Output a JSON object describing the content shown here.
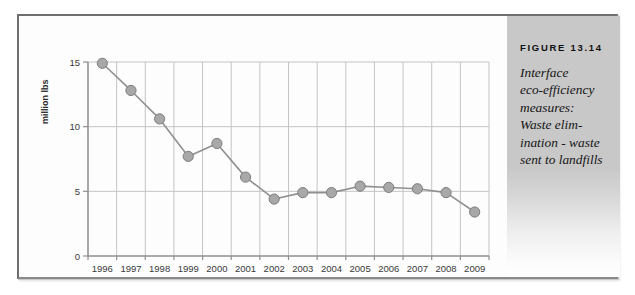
{
  "figure": {
    "caption_number": "FIGURE 13.14",
    "caption_text": "Interface eco-efficiency measures: Waste elimination - waste sent to landfills",
    "caption_lines": [
      "Interface",
      "eco-efficiency",
      "measures:",
      "Waste elim-",
      "ination - waste",
      "sent to landfills"
    ]
  },
  "colors": {
    "marker_fill": "#a8a8a8",
    "marker_stroke": "#7d7d7d",
    "line": "#909090",
    "grid": "#c4c4c4",
    "axis": "#8f8f8f",
    "panel_bg": "#c8c8c8",
    "frame": "#8a8a8a"
  },
  "chart_data": {
    "type": "line",
    "title": "",
    "xlabel": "",
    "ylabel": "million lbs",
    "categories": [
      "1996",
      "1997",
      "1998",
      "1999",
      "2000",
      "2001",
      "2002",
      "2003",
      "2004",
      "2005",
      "2006",
      "2007",
      "2008",
      "2009"
    ],
    "values": [
      14.9,
      12.8,
      10.6,
      7.7,
      8.7,
      6.1,
      4.4,
      4.9,
      4.9,
      5.4,
      5.3,
      5.2,
      4.9,
      3.4
    ],
    "series": [
      {
        "name": "Waste sent to landfills",
        "values": [
          14.9,
          12.8,
          10.6,
          7.7,
          8.7,
          6.1,
          4.4,
          4.9,
          4.9,
          5.4,
          5.3,
          5.2,
          4.9,
          3.4
        ]
      }
    ],
    "ylim": [
      0,
      15
    ],
    "yticks": [
      0,
      5,
      10,
      15
    ],
    "ytick_labels": [
      "0",
      "5",
      "10",
      "15"
    ],
    "xtick_labels": [
      "1996",
      "1997",
      "1998",
      "1999",
      "2000",
      "2001",
      "2002",
      "2003",
      "2004",
      "2005",
      "2006",
      "2007",
      "2008",
      "2009"
    ],
    "grid": "both",
    "legend": "none",
    "markers": "circle"
  }
}
